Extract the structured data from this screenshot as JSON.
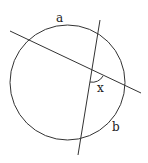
{
  "diagram": {
    "type": "circle-intersecting-chords",
    "labels": {
      "arc_a": "a",
      "arc_b": "b",
      "angle_x": "x"
    },
    "colors": {
      "stroke": "#333333",
      "background": "#ffffff"
    }
  }
}
